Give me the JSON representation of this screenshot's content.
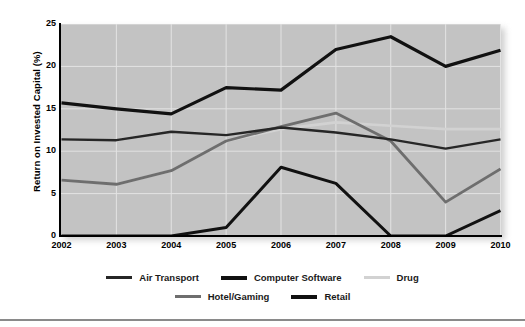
{
  "chart_data": {
    "type": "line",
    "title": "",
    "xlabel": "",
    "ylabel": "Return on Invested Capital (%)",
    "categories": [
      "2002",
      "2003",
      "2004",
      "2005",
      "2006",
      "2007",
      "2008",
      "2009",
      "2010"
    ],
    "x": [
      2002,
      2003,
      2004,
      2005,
      2006,
      2007,
      2008,
      2009,
      2010
    ],
    "xlim": [
      2002,
      2010
    ],
    "ylim": [
      0,
      25
    ],
    "yticks": [
      25,
      20,
      15,
      10,
      5,
      0
    ],
    "ytick_labels": [
      "25",
      "20",
      "15",
      "10",
      "5",
      "0"
    ],
    "grid": true,
    "grid_color": "#e3e3e3",
    "plot_background": "#c3c3c3",
    "legend_position": "below",
    "series": [
      {
        "name": "Air Transport",
        "color": "#262626",
        "width": 2.4,
        "values": [
          11.4,
          11.3,
          12.3,
          11.9,
          12.8,
          12.2,
          11.4,
          10.3,
          11.4
        ]
      },
      {
        "name": "Computer Software",
        "color": "#111111",
        "width": 3.2,
        "values": [
          15.7,
          15.0,
          14.4,
          17.5,
          17.2,
          22.0,
          23.5,
          20.0,
          21.9
        ]
      },
      {
        "name": "Drug",
        "color": "#d2d2d2",
        "width": 2.6,
        "values": [
          6.6,
          6.1,
          7.7,
          11.2,
          12.6,
          13.4,
          13.0,
          12.6,
          12.6
        ]
      },
      {
        "name": "Hotel/Gaming",
        "color": "#6e6e6e",
        "width": 2.8,
        "values": [
          6.6,
          6.1,
          7.7,
          11.2,
          12.9,
          14.5,
          11.2,
          4.0,
          7.9
        ]
      },
      {
        "name": "Retail",
        "color": "#111111",
        "width": 3.0,
        "values": [
          0.0,
          0.0,
          0.0,
          1.0,
          8.1,
          6.2,
          0.0,
          0.0,
          3.0
        ]
      }
    ]
  },
  "legend": {
    "row1": [
      "Air Transport",
      "Computer Software",
      "Drug"
    ],
    "row2": [
      "Hotel/Gaming",
      "Retail"
    ]
  }
}
